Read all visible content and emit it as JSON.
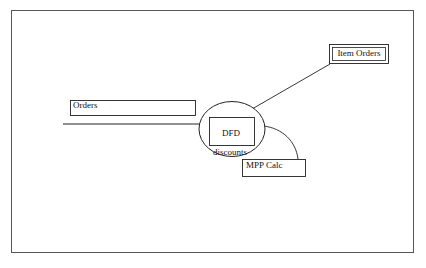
{
  "diagram": {
    "type": "data-flow-diagram",
    "background_color": "#ffffff",
    "stroke_color": "#222222",
    "frame_color": "#565656",
    "frame": {
      "x": 11,
      "y": 10,
      "width": 403,
      "height": 243
    },
    "nodes": [
      {
        "id": "orders-store",
        "shape": "rectangle",
        "label": "Orders",
        "x": 70,
        "y": 100,
        "width": 126,
        "height": 16
      },
      {
        "id": "process-discounts",
        "shape": "ellipse",
        "label_line1": "DFD",
        "label_line2": "discounts",
        "cx": 232,
        "cy": 129,
        "rx": 33,
        "ry": 27.5,
        "inner_rect": {
          "x": 209,
          "y": 117,
          "width": 46,
          "height": 29
        }
      },
      {
        "id": "item-orders-entity",
        "shape": "double-rectangle",
        "label": "Item Orders",
        "x": 329,
        "y": 44,
        "width": 60,
        "height": 20
      },
      {
        "id": "mpp-calc-box",
        "shape": "rectangle",
        "label": "MPP Calc",
        "x": 242,
        "y": 159,
        "width": 64,
        "height": 18
      }
    ],
    "connectors": [
      {
        "id": "orders-flow-line",
        "kind": "straight",
        "from": "orders-store",
        "to": "process-discounts",
        "points": "63,124 201,124"
      },
      {
        "id": "item-orders-flow-line",
        "kind": "straight",
        "from": "process-discounts",
        "to": "item-orders-entity",
        "points": "252,109 330,64"
      },
      {
        "id": "mpp-calc-flow-arc",
        "kind": "curved",
        "from": "process-discounts",
        "to": "mpp-calc-box",
        "path": "M 263,126 C 283,128 296,142 298,159"
      }
    ]
  }
}
